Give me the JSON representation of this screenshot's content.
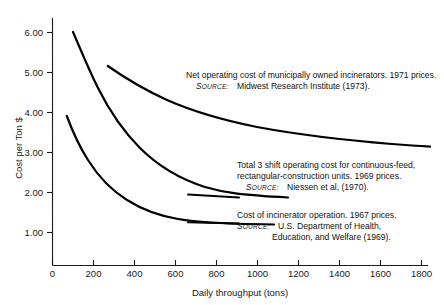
{
  "chart_data": {
    "type": "line",
    "title": "",
    "xlabel": "Daily throughput (tons)",
    "ylabel": "Cost per Ton $",
    "xlim": [
      0,
      1960
    ],
    "ylim": [
      0,
      6.4
    ],
    "grid": false,
    "legend_position": "inline-annotations",
    "xticks": [
      0,
      200,
      400,
      600,
      800,
      1000,
      1200,
      1400,
      1600,
      1800
    ],
    "xticklabels": [
      "0",
      "200",
      "400",
      "600",
      "800",
      "1000",
      "1200",
      "1400",
      "1600",
      "1800"
    ],
    "yticks": [
      1.0,
      2.0,
      3.0,
      4.0,
      5.0,
      6.0
    ],
    "yticklabels": [
      "1.00",
      "2.00",
      "3.00",
      "4.00",
      "5.00",
      "6.00"
    ],
    "series": [
      {
        "name": "Net operating cost of municipally owned incinerators, 1971 prices",
        "x": [
          270,
          350,
          450,
          550,
          700,
          850,
          1000,
          1200,
          1400,
          1600,
          1800,
          1900
        ],
        "y": [
          5.15,
          4.85,
          4.56,
          4.35,
          4.1,
          3.92,
          3.78,
          3.62,
          3.5,
          3.41,
          3.34,
          3.31
        ]
      },
      {
        "name": "Total 3 shift operating cost for continuous-feed, rectangular-construction units, 1969 prices",
        "x": [
          100,
          130,
          170,
          220,
          280,
          350,
          430,
          520,
          640,
          780,
          930,
          1080,
          1150
        ],
        "y": [
          6.0,
          5.35,
          4.7,
          4.1,
          3.6,
          3.2,
          2.92,
          2.7,
          2.5,
          2.36,
          2.26,
          2.19,
          2.17
        ]
      },
      {
        "name": "Cost of incinerator operation, 1967 prices",
        "x": [
          70,
          100,
          140,
          190,
          250,
          320,
          400,
          500,
          620,
          760,
          900,
          1040,
          1080
        ],
        "y": [
          3.9,
          3.52,
          3.12,
          2.76,
          2.45,
          2.22,
          2.04,
          1.9,
          1.79,
          1.71,
          1.66,
          1.63,
          1.62
        ]
      }
    ],
    "annotations": [
      {
        "id": "annotation-1",
        "line1": "Net operating cost of municipally owned incinerators. 1971 prices.",
        "source_label": "SOURCE:",
        "source_body": "Midwest Research Institute (1973).",
        "source_body_2": ""
      },
      {
        "id": "annotation-2",
        "line1": "Total 3 shift operating cost for continuous-feed,",
        "line2": "rectangular-construction units. 1969 prices.",
        "source_label": "SOURCE:",
        "source_body": "Niessen et al, (1970).",
        "source_body_2": ""
      },
      {
        "id": "annotation-3",
        "line1": "Cost of incinerator operation. 1967 prices.",
        "source_label": "SOURCE:",
        "source_body": "U.S. Department of Health,",
        "source_body_2": "Education, and Welfare (1969)."
      }
    ],
    "colors": {
      "curve": "#000000",
      "axis": "#1a1a1a",
      "text": "#111111",
      "background": "#ffffff"
    }
  }
}
